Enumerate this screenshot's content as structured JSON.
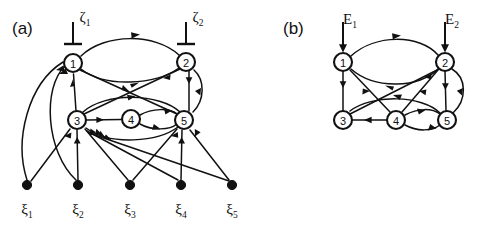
{
  "figure": {
    "background_color": "#ffffff",
    "line_color": "#111111",
    "node_fill": "#ffffff",
    "width": 481,
    "height": 229
  },
  "panels": [
    {
      "id": "a",
      "label": "(a)",
      "nodes": [
        {
          "id": "1",
          "label": "1",
          "cx": 73,
          "cy": 63,
          "r": 9
        },
        {
          "id": "2",
          "label": "2",
          "cx": 186,
          "cy": 62,
          "r": 9
        },
        {
          "id": "3",
          "label": "3",
          "cx": 77,
          "cy": 120,
          "r": 9
        },
        {
          "id": "4",
          "label": "4",
          "cx": 131,
          "cy": 119,
          "r": 9
        },
        {
          "id": "5",
          "label": "5",
          "cx": 184,
          "cy": 120,
          "r": 9
        }
      ],
      "inputs": [
        {
          "id": "zeta1",
          "label": "ζ",
          "subscript": "1",
          "target_node": "1",
          "x": 73,
          "y_top": 22,
          "style": "blunt-bar"
        },
        {
          "id": "zeta2",
          "label": "ζ",
          "subscript": "2",
          "target_node": "2",
          "x": 186,
          "y_top": 22,
          "style": "blunt-bar"
        }
      ],
      "sources": [
        {
          "id": "xi1",
          "label": "ξ",
          "subscript": "1",
          "cx": 27,
          "cy": 185
        },
        {
          "id": "xi2",
          "label": "ξ",
          "subscript": "2",
          "cx": 78,
          "cy": 185
        },
        {
          "id": "xi3",
          "label": "ξ",
          "subscript": "3",
          "cx": 130,
          "cy": 185
        },
        {
          "id": "xi4",
          "label": "ξ",
          "subscript": "4",
          "cx": 181,
          "cy": 185
        },
        {
          "id": "xi5",
          "label": "ξ",
          "subscript": "5",
          "cx": 232,
          "cy": 185
        }
      ],
      "edges": [
        {
          "from": "2",
          "to": "1",
          "kind": "arc-upper"
        },
        {
          "from": "1",
          "to": "2",
          "kind": "arc-lower"
        },
        {
          "from": "3",
          "to": "1",
          "kind": "straight-vertical"
        },
        {
          "from": "2",
          "to": "5",
          "kind": "straight-vertical"
        },
        {
          "from": "5",
          "to": "2",
          "kind": "arc-right"
        },
        {
          "from": "1",
          "to": "5",
          "kind": "diagonal"
        },
        {
          "from": "3",
          "to": "2",
          "kind": "diagonal"
        },
        {
          "from": "3",
          "to": "4",
          "kind": "straight-horizontal"
        },
        {
          "from": "4",
          "to": "5",
          "kind": "arc-upper-small"
        },
        {
          "from": "5",
          "to": "4",
          "kind": "arc-lower-small"
        },
        {
          "from": "3",
          "to": "5",
          "kind": "arc-over-4"
        },
        {
          "from": "5",
          "to": "3",
          "kind": "arc-under-4"
        },
        {
          "from": "xi1",
          "to": "1",
          "kind": "long-curve"
        },
        {
          "from": "xi1",
          "to": "3",
          "kind": "straight"
        },
        {
          "from": "xi2",
          "to": "1",
          "kind": "long-curve"
        },
        {
          "from": "xi2",
          "to": "3",
          "kind": "straight"
        },
        {
          "from": "xi3",
          "to": "3",
          "kind": "straight"
        },
        {
          "from": "xi3",
          "to": "5",
          "kind": "straight"
        },
        {
          "from": "xi4",
          "to": "3",
          "kind": "straight"
        },
        {
          "from": "xi4",
          "to": "5",
          "kind": "straight"
        },
        {
          "from": "xi5",
          "to": "3",
          "kind": "straight"
        },
        {
          "from": "xi5",
          "to": "5",
          "kind": "straight"
        }
      ]
    },
    {
      "id": "b",
      "label": "(b)",
      "nodes": [
        {
          "id": "1",
          "label": "1",
          "cx": 343,
          "cy": 62,
          "r": 9
        },
        {
          "id": "2",
          "label": "2",
          "cx": 445,
          "cy": 62,
          "r": 9
        },
        {
          "id": "3",
          "label": "3",
          "cx": 343,
          "cy": 120,
          "r": 9
        },
        {
          "id": "4",
          "label": "4",
          "cx": 396,
          "cy": 120,
          "r": 9
        },
        {
          "id": "5",
          "label": "5",
          "cx": 447,
          "cy": 120,
          "r": 9
        }
      ],
      "inputs": [
        {
          "id": "E1",
          "label": "E",
          "subscript": "1",
          "target_node": "1",
          "x": 343,
          "y_top": 22,
          "style": "arrow"
        },
        {
          "id": "E2",
          "label": "E",
          "subscript": "2",
          "target_node": "2",
          "x": 445,
          "y_top": 22,
          "style": "arrow"
        }
      ],
      "sources": [],
      "edges": [
        {
          "from": "1",
          "to": "2",
          "kind": "arc-upper"
        },
        {
          "from": "2",
          "to": "1",
          "kind": "arc-lower"
        },
        {
          "from": "1",
          "to": "3",
          "kind": "straight-vertical"
        },
        {
          "from": "2",
          "to": "5",
          "kind": "straight-vertical"
        },
        {
          "from": "5",
          "to": "2",
          "kind": "arc-right"
        },
        {
          "from": "1",
          "to": "4",
          "kind": "diagonal"
        },
        {
          "from": "2",
          "to": "4",
          "kind": "diagonal"
        },
        {
          "from": "3",
          "to": "2",
          "kind": "diagonal"
        },
        {
          "from": "5",
          "to": "3",
          "kind": "arc-over-4"
        },
        {
          "from": "4",
          "to": "3",
          "kind": "straight-horizontal"
        },
        {
          "from": "5",
          "to": "4",
          "kind": "arc-upper-small"
        },
        {
          "from": "4",
          "to": "5",
          "kind": "arc-lower-small"
        }
      ]
    }
  ]
}
